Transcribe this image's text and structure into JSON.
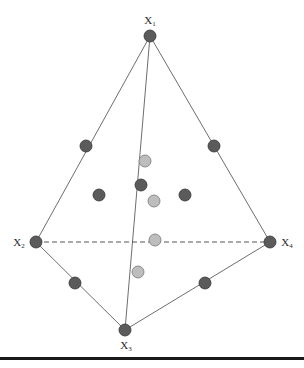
{
  "diagram": {
    "type": "tetrahedron-design-points",
    "colors": {
      "edge": "#6e6e6e",
      "dashed_edge": "#555555",
      "vertex_fill": "#5b5b5b",
      "vertex_stroke": "#333333",
      "edge_midpoint_fill": "#5b5b5b",
      "interior_fill": "#bdbdbd",
      "interior_stroke": "#777777",
      "rule": "#1a1a1a"
    },
    "vertices": [
      {
        "id": "X1",
        "base": "X",
        "sub": "1",
        "x": 150,
        "y": 36,
        "label_x": 150,
        "label_y": 21
      },
      {
        "id": "X2",
        "base": "X",
        "sub": "2",
        "x": 36,
        "y": 242,
        "label_x": 19,
        "label_y": 243
      },
      {
        "id": "X3",
        "base": "X",
        "sub": "3",
        "x": 125,
        "y": 330,
        "label_x": 126,
        "label_y": 346
      },
      {
        "id": "X4",
        "base": "X",
        "sub": "4",
        "x": 270,
        "y": 242,
        "label_x": 287,
        "label_y": 243
      }
    ],
    "edges": [
      {
        "from": "X1",
        "to": "X2",
        "style": "solid"
      },
      {
        "from": "X1",
        "to": "X4",
        "style": "solid"
      },
      {
        "from": "X1",
        "to": "X3",
        "style": "solid"
      },
      {
        "from": "X2",
        "to": "X3",
        "style": "solid"
      },
      {
        "from": "X3",
        "to": "X4",
        "style": "solid"
      },
      {
        "from": "X2",
        "to": "X4",
        "style": "dashed"
      }
    ],
    "points": [
      {
        "name": "midpoint-x1-x2",
        "kind": "dark",
        "x": 86,
        "y": 146
      },
      {
        "name": "midpoint-x1-x4",
        "kind": "dark",
        "x": 214,
        "y": 146
      },
      {
        "name": "midpoint-x2-x3",
        "kind": "dark",
        "x": 75,
        "y": 283
      },
      {
        "name": "midpoint-x3-x4",
        "kind": "dark",
        "x": 205,
        "y": 283
      },
      {
        "name": "midpoint-x1-x3",
        "kind": "dark",
        "x": 141,
        "y": 185
      },
      {
        "name": "face-centroid-left",
        "kind": "dark",
        "x": 99,
        "y": 195
      },
      {
        "name": "face-centroid-right",
        "kind": "dark",
        "x": 185,
        "y": 195
      },
      {
        "name": "interior-point-upper",
        "kind": "light",
        "x": 145,
        "y": 161
      },
      {
        "name": "interior-point-center",
        "kind": "light",
        "x": 154,
        "y": 201
      },
      {
        "name": "interior-point-on-x2-x4",
        "kind": "light",
        "x": 155,
        "y": 240
      },
      {
        "name": "interior-point-lower",
        "kind": "light",
        "x": 138,
        "y": 272
      }
    ],
    "point_radius": 6
  }
}
